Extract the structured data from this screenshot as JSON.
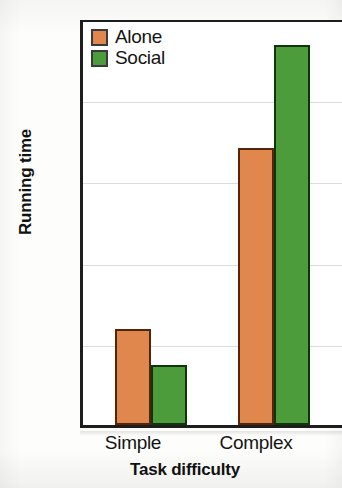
{
  "chart_data": {
    "type": "bar",
    "title": "",
    "xlabel": "Task difficulty",
    "ylabel": "Running time",
    "categories": [
      "Simple",
      "Complex"
    ],
    "series": [
      {
        "name": "Alone",
        "color": "#E0874E",
        "values": [
          59,
          170
        ]
      },
      {
        "name": "Social",
        "color": "#4C9C3C",
        "values": [
          37,
          233
        ]
      }
    ],
    "ylim": [
      0,
      250
    ],
    "yticks": [
      0,
      50,
      100,
      150,
      200,
      250
    ],
    "ytick_labels": [
      "0",
      "50",
      "100",
      "150",
      "200",
      "250"
    ],
    "grid": "horizontal",
    "legend_position": "top-left-inside"
  },
  "axis": {
    "y_title": "Running time",
    "x_title": "Task difficulty",
    "ticks_y": [
      "250",
      "200",
      "150",
      "100",
      "50",
      "0"
    ],
    "ticks_x": [
      "Simple",
      "Complex"
    ]
  },
  "legend": {
    "items": [
      {
        "label": "Alone",
        "color": "#E0874E"
      },
      {
        "label": "Social",
        "color": "#4C9C3C"
      }
    ]
  },
  "colors": {
    "alone": "#E0874E",
    "social": "#4C9C3C",
    "axis": "#1d1d1d",
    "grid": "#dcdcdc",
    "background": "#ffffff"
  }
}
